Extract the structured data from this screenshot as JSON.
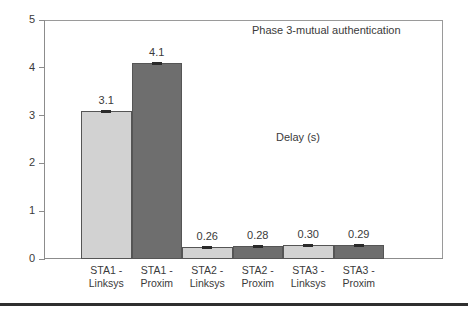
{
  "chart_data": {
    "type": "bar",
    "title": "",
    "xlabel": "",
    "ylabel": "",
    "ylim": [
      0,
      5
    ],
    "yticks": [
      0,
      1,
      2,
      3,
      4,
      5
    ],
    "grid": false,
    "legend": "none",
    "categories": [
      "STA1 - Linksys",
      "STA1 - Proxim",
      "STA2 - Linksys",
      "STA2 - Proxim",
      "STA3 - Linksys",
      "STA3 - Proxim"
    ],
    "category_lines": [
      {
        "line1": "STA1 -",
        "line2": "Linksys"
      },
      {
        "line1": "STA1 -",
        "line2": "Proxim"
      },
      {
        "line1": "STA2 -",
        "line2": "Linksys"
      },
      {
        "line1": "STA2 -",
        "line2": "Proxim"
      },
      {
        "line1": "STA3 -",
        "line2": "Linksys"
      },
      {
        "line1": "STA3 -",
        "line2": "Proxim"
      }
    ],
    "values": [
      3.1,
      4.1,
      0.26,
      0.28,
      0.3,
      0.29
    ],
    "value_labels": [
      "3.1",
      "4.1",
      "0.26",
      "0.28",
      "0.30",
      "0.29"
    ],
    "bar_colors": [
      "#d2d2d2",
      "#6e6e6e",
      "#d2d2d2",
      "#6e6e6e",
      "#d2d2d2",
      "#6e6e6e"
    ],
    "has_error_bars": true,
    "annotations": [
      "Phase 3-mutual authentication",
      "Delay (s)"
    ]
  },
  "annotations": {
    "phase_title": "Phase 3-mutual authentication",
    "delay_label": "Delay (s)"
  },
  "axis": {
    "y_tick_labels": [
      "0",
      "1",
      "2",
      "3",
      "4",
      "5"
    ]
  },
  "colors": {
    "bar_light": "#d2d2d2",
    "bar_dark": "#6e6e6e",
    "frame": "#9a9a9a",
    "text": "#3a3a3a",
    "rule": "#2f2f2f"
  }
}
